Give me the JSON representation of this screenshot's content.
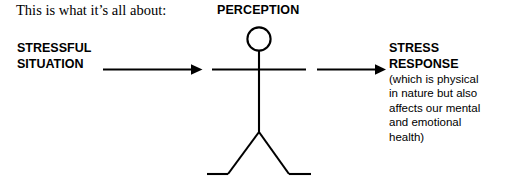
{
  "canvas": {
    "width": 506,
    "height": 186,
    "background": "#ffffff",
    "ink": "#000000"
  },
  "caption": {
    "text": "This is what it’s all about:"
  },
  "figure": {
    "label_top": "PERCEPTION",
    "icon": "stick-figure-person"
  },
  "left_label": {
    "line1": "STRESSFUL",
    "line2": "SITUATION"
  },
  "right_label": {
    "title_line1": "STRESS",
    "title_line2": "RESPONSE",
    "note_line1": "(which is physical",
    "note_line2": "in nature but also",
    "note_line3": "affects our mental",
    "note_line4": "and emotional",
    "note_line5": "health)"
  },
  "arrows": {
    "left_arrow": "arrow-right-icon",
    "right_arrow": "arrow-right-icon"
  }
}
